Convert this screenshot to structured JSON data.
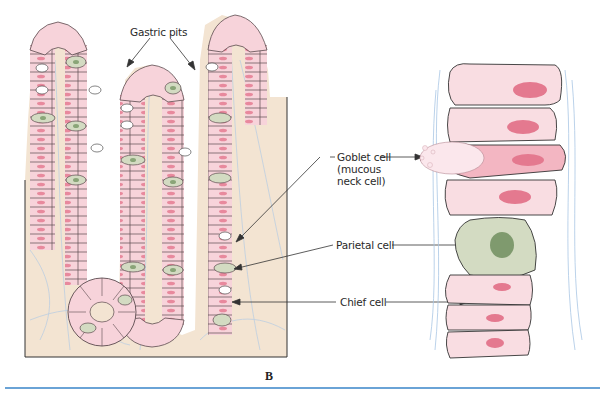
{
  "figure": {
    "panel_letter": "B",
    "labels": {
      "gastric_pits": "Gastric pits",
      "goblet_cell_line1": "Goblet cell",
      "goblet_cell_line2": "(mucous",
      "goblet_cell_line3": "neck cell)",
      "parietal_cell": "Parietal cell",
      "chief_cell": "Chief cell"
    },
    "colors": {
      "lamina_propria": "#f3e4d2",
      "epithelial_cell": "#f7d3da",
      "epithelial_nucleus": "#e4798f",
      "parietal_cell": "#d3dbc2",
      "parietal_nucleus": "#8aa578",
      "outline": "#3a3a3a",
      "connective_fibers": "#a9c6e4",
      "rule_line": "#6aa3d6"
    }
  }
}
